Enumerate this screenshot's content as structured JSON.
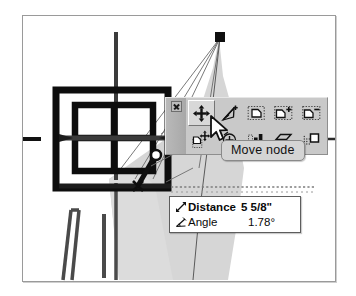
{
  "app": {
    "context": "cad-floorplan-node-editing"
  },
  "canvas": {
    "name": "drawing-canvas",
    "background_color": "#ffffff",
    "shading_color": "#d4d4d4",
    "line_color": "#3a3a3a",
    "accent_color": "#111111"
  },
  "toolbar": {
    "name": "node-edit-toolbar",
    "close_label": "x",
    "tools": [
      {
        "id": "move-node",
        "icon": "move-node-icon",
        "label": "Move node",
        "active": true
      },
      {
        "id": "add-node",
        "icon": "add-node-icon",
        "label": "Add node",
        "active": false
      },
      {
        "id": "copy-shape",
        "icon": "copy-shape-icon",
        "label": "Copy shape",
        "active": false
      },
      {
        "id": "add-shape",
        "icon": "add-shape-icon",
        "label": "Add shape",
        "active": false
      },
      {
        "id": "remove-shape",
        "icon": "remove-shape-icon",
        "label": "Remove shape",
        "active": false
      },
      {
        "id": "move-shape",
        "icon": "move-shape-icon",
        "label": "Move shape",
        "active": false
      },
      {
        "id": "rotate-node",
        "icon": "rotate-node-icon",
        "label": "Rotate node",
        "active": false
      },
      {
        "id": "align-elements",
        "icon": "align-elements-icon",
        "label": "Align elements",
        "active": false
      },
      {
        "id": "flatten-surface",
        "icon": "flatten-surface-icon",
        "label": "Flatten surface",
        "active": false
      },
      {
        "id": "select-region",
        "icon": "select-region-icon",
        "label": "Select region",
        "active": false
      }
    ]
  },
  "tooltip": {
    "name": "move-node-tooltip",
    "text": "Move node"
  },
  "info_box": {
    "name": "measurement-readout",
    "rows": [
      {
        "icon": "distance-arrow-icon",
        "label": "Distance",
        "value": "5 5/8\""
      },
      {
        "icon": "angle-icon",
        "label": "Angle",
        "value": "1.78°"
      }
    ]
  }
}
